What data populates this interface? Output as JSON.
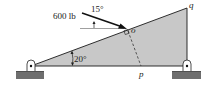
{
  "diagram": {
    "type": "statics free-body diagram",
    "force": {
      "label": "600 lb",
      "angle_label": "15°"
    },
    "incline": {
      "angle_label": "20°"
    },
    "points": {
      "o": "o",
      "p": "p",
      "q": "q"
    },
    "supports": [
      "left pin support",
      "right pin support"
    ],
    "colors": {
      "triangle_fill": "#c8c8c8",
      "line": "#1a1a1a",
      "ground": "#6e6e6e",
      "background": "#ffffff"
    }
  }
}
